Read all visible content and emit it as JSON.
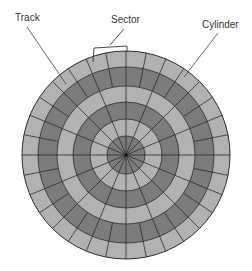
{
  "diagram": {
    "labels": {
      "track": "Track",
      "sector": "Sector",
      "cylinder": "Cylinder"
    },
    "colors": {
      "light_band": "#b2b2b2",
      "dark_band": "#7c7c7c",
      "lines": "#2a2a2a",
      "text": "#333333"
    },
    "rings": 6,
    "sectors_per_track": 16
  }
}
